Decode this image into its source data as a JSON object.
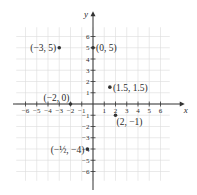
{
  "chart_data": {
    "type": "scatter",
    "title": "",
    "xlabel": "x",
    "ylabel": "y",
    "xlim": [
      -7,
      7
    ],
    "ylim": [
      -7,
      7
    ],
    "grid": true,
    "x_ticks": [
      -6,
      -5,
      -4,
      -3,
      -2,
      -1,
      1,
      2,
      3,
      4,
      5,
      6
    ],
    "y_ticks": [
      -6,
      -5,
      -4,
      -3,
      -2,
      -1,
      1,
      2,
      3,
      4,
      5,
      6
    ],
    "x_tick_labels": [
      "−6",
      "−5",
      "−4",
      "−3",
      "−2",
      "−1",
      "1",
      "2",
      "3",
      "4",
      "5",
      "6"
    ],
    "y_tick_labels": [
      "−6",
      "−5",
      "−4",
      "−3",
      "−2",
      "−1",
      "1",
      "2",
      "3",
      "4",
      "5",
      "6"
    ],
    "series": [
      {
        "name": "points",
        "points": [
          {
            "x": -3,
            "y": 5,
            "label": "(−3, 5)",
            "label_pos": "left"
          },
          {
            "x": 0,
            "y": 5,
            "label": "(0, 5)",
            "label_pos": "right"
          },
          {
            "x": 1.5,
            "y": 1.5,
            "label": "(1.5, 1.5)",
            "label_pos": "right"
          },
          {
            "x": -2,
            "y": 0,
            "label": "(−2, 0)",
            "label_pos": "above-left"
          },
          {
            "x": 2,
            "y": -1,
            "label": "(2, −1)",
            "label_pos": "below-right"
          },
          {
            "x": -0.5,
            "y": -4,
            "label": "(−½, −4)",
            "label_pos": "left"
          }
        ]
      }
    ]
  },
  "layout": {
    "origin_px": [
      93,
      104
    ],
    "unit_px": 11.25,
    "grid_extent": {
      "xmin": -7,
      "xmax": 7,
      "ymin": -7,
      "ymax": 7
    }
  },
  "colors": {
    "point": "#333333",
    "axis": "#333333",
    "grid": "#dcdcdc",
    "text": "#2a2a2a"
  }
}
